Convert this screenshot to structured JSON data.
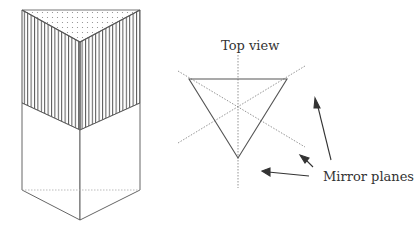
{
  "labels": {
    "top_view": "Top view",
    "mirror_planes": "Mirror planes"
  },
  "colors": {
    "line": "#555555",
    "hatch": "#666666",
    "dots": "#888888",
    "dashed": "#999999"
  }
}
